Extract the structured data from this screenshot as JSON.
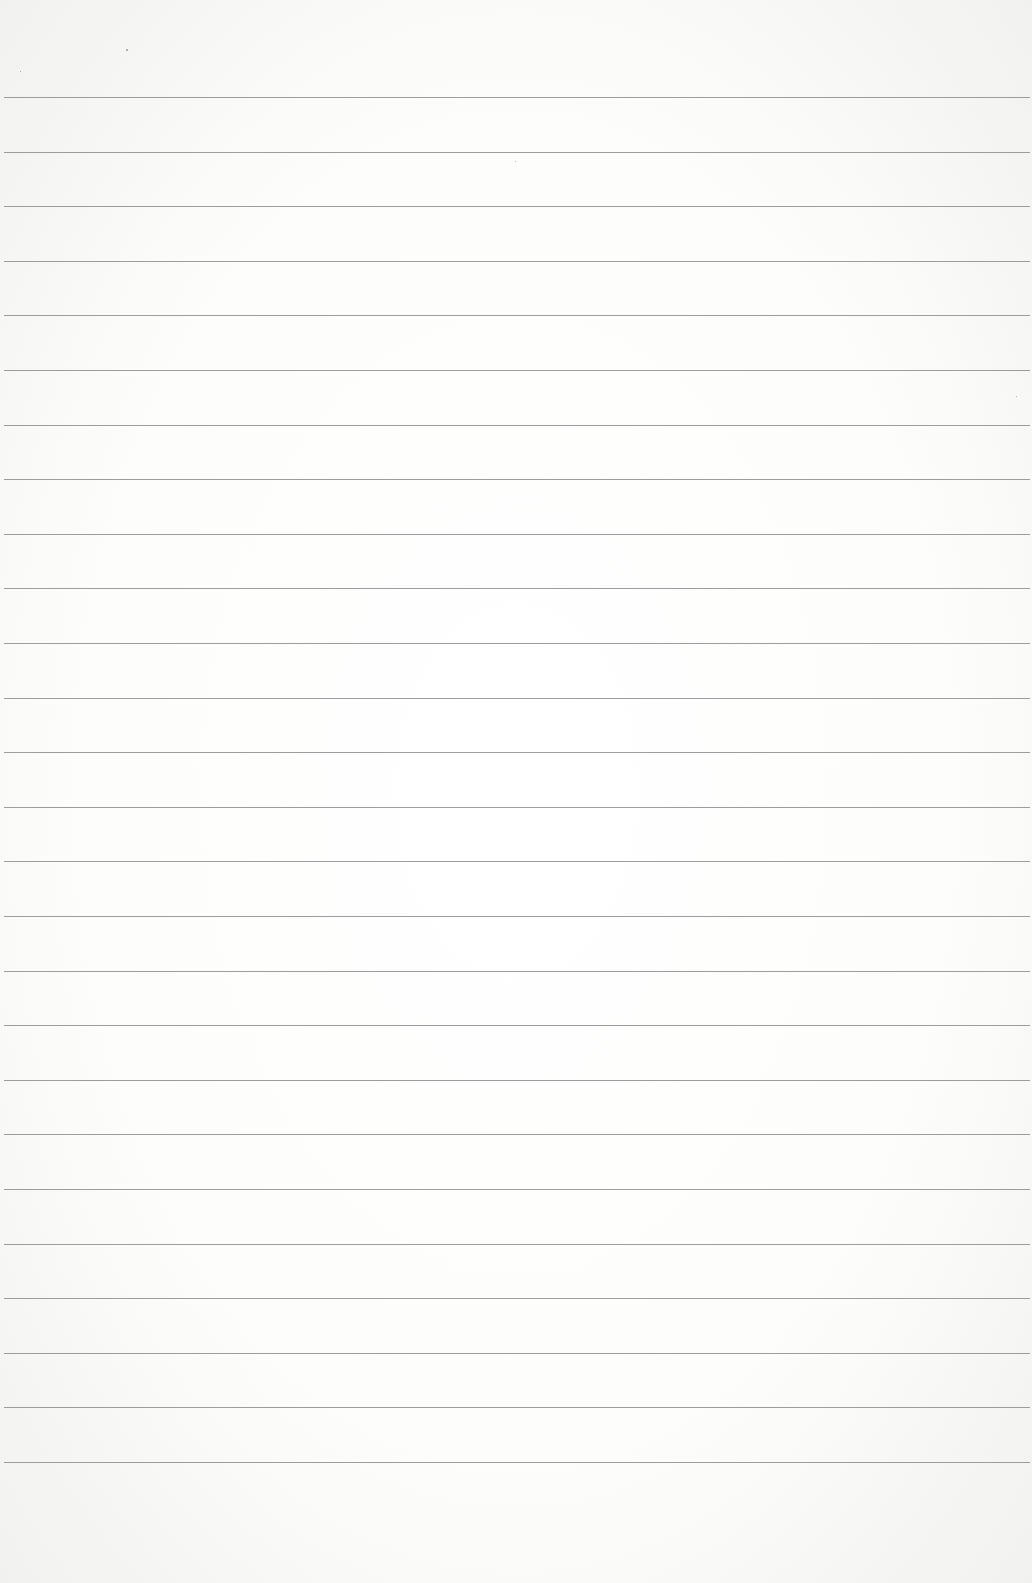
{
  "document": {
    "type": "ruled-paper",
    "line_count": 26,
    "first_line_y": 97,
    "line_spacing": 54.6,
    "line_color": "#8c8c8c",
    "background_color": "#fdfdfc"
  }
}
